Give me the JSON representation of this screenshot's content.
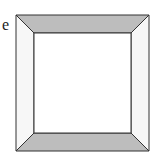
{
  "figure": {
    "label": "e",
    "outer_square": {
      "x1": 16,
      "y1": 15,
      "x2": 149,
      "y2": 151
    },
    "inner_square": {
      "x1": 34,
      "y1": 33,
      "x2": 131,
      "y2": 133
    },
    "colors": {
      "shaded": "#bdbdbd",
      "unshaded": "#f7f7f7",
      "inner": "#ffffff",
      "stroke": "#333333"
    }
  }
}
